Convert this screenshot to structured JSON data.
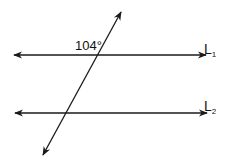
{
  "diagram": {
    "type": "parallel-lines-transversal",
    "angle_label": "104°",
    "lines": [
      {
        "name": "L",
        "subscript": "1",
        "y": 55
      },
      {
        "name": "L",
        "subscript": "2",
        "y": 113
      }
    ],
    "transversal": {
      "top": [
        121,
        12
      ],
      "bottom": [
        43,
        155
      ]
    },
    "colors": {
      "stroke": "#1a1a1a",
      "background": "#ffffff"
    }
  }
}
